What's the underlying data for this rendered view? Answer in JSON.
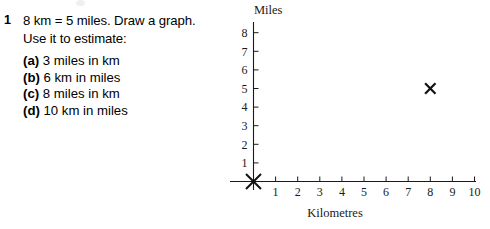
{
  "question": {
    "number": "1",
    "lines": [
      "8 km  =  5 miles. Draw a graph.",
      "Use it to estimate:"
    ],
    "parts": [
      {
        "marker": "(a)",
        "text": "3 miles in km"
      },
      {
        "marker": "(b)",
        "text": "6 km in miles"
      },
      {
        "marker": "(c)",
        "text": "8 miles in km"
      },
      {
        "marker": "(d)",
        "text": "10 km in miles"
      }
    ]
  },
  "chart_data": {
    "type": "scatter",
    "title": "",
    "xlabel": "Kilometres",
    "ylabel": "Miles",
    "xlim": [
      0,
      10
    ],
    "ylim": [
      0,
      8
    ],
    "xticks": [
      "1",
      "2",
      "3",
      "4",
      "5",
      "6",
      "7",
      "8",
      "9",
      "10"
    ],
    "yticks": [
      "1",
      "2",
      "3",
      "4",
      "5",
      "6",
      "7",
      "8"
    ],
    "grid": false,
    "legend": "none",
    "series": [
      {
        "name": "plotted points",
        "marker": "x",
        "points": [
          {
            "x": 0,
            "y": 0
          },
          {
            "x": 8,
            "y": 5
          }
        ]
      }
    ],
    "annotations": []
  }
}
